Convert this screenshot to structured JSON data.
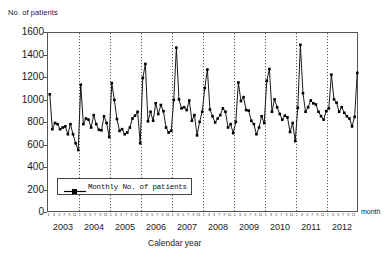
{
  "figure": {
    "y_axis_title": "No. of patients",
    "x_axis_title": "Calendar year",
    "month_axis_caption": "month"
  },
  "legend": {
    "label": "Monthly No. of patients",
    "marker": "line-with-square-marker"
  },
  "chart_data": {
    "type": "line",
    "title": "",
    "subtitle": "",
    "xlabel": "Calendar year",
    "ylabel": "No. of patients",
    "ylim": [
      0,
      1600
    ],
    "ytick_labels": [
      "0",
      "200",
      "400",
      "600",
      "800",
      "1000",
      "1200",
      "1400",
      "1600"
    ],
    "yticks": [
      0,
      200,
      400,
      600,
      800,
      1000,
      1200,
      1400,
      1600
    ],
    "grid": "vertical dotted gridlines at each January (year boundary)",
    "legend_position": "inside lower-left",
    "month_tick_labels": [
      "1",
      "3",
      "5",
      "7",
      "9",
      "11"
    ],
    "years": [
      "2003",
      "2004",
      "2005",
      "2006",
      "2007",
      "2008",
      "2009",
      "2010",
      "2011",
      "2012"
    ],
    "series": [
      {
        "name": "Monthly No. of patients",
        "marker": "filled square",
        "color": "#000000",
        "x": [
          "2003-01",
          "2003-02",
          "2003-03",
          "2003-04",
          "2003-05",
          "2003-06",
          "2003-07",
          "2003-08",
          "2003-09",
          "2003-10",
          "2003-11",
          "2003-12",
          "2004-01",
          "2004-02",
          "2004-03",
          "2004-04",
          "2004-05",
          "2004-06",
          "2004-07",
          "2004-08",
          "2004-09",
          "2004-10",
          "2004-11",
          "2004-12",
          "2005-01",
          "2005-02",
          "2005-03",
          "2005-04",
          "2005-05",
          "2005-06",
          "2005-07",
          "2005-08",
          "2005-09",
          "2005-10",
          "2005-11",
          "2005-12",
          "2006-01",
          "2006-02",
          "2006-03",
          "2006-04",
          "2006-05",
          "2006-06",
          "2006-07",
          "2006-08",
          "2006-09",
          "2006-10",
          "2006-11",
          "2006-12",
          "2007-01",
          "2007-02",
          "2007-03",
          "2007-04",
          "2007-05",
          "2007-06",
          "2007-07",
          "2007-08",
          "2007-09",
          "2007-10",
          "2007-11",
          "2007-12",
          "2008-01",
          "2008-02",
          "2008-03",
          "2008-04",
          "2008-05",
          "2008-06",
          "2008-07",
          "2008-08",
          "2008-09",
          "2008-10",
          "2008-11",
          "2008-12",
          "2009-01",
          "2009-02",
          "2009-03",
          "2009-04",
          "2009-05",
          "2009-06",
          "2009-07",
          "2009-08",
          "2009-09",
          "2009-10",
          "2009-11",
          "2009-12",
          "2010-01",
          "2010-02",
          "2010-03",
          "2010-04",
          "2010-05",
          "2010-06",
          "2010-07",
          "2010-08",
          "2010-09",
          "2010-10",
          "2010-11",
          "2010-12",
          "2011-01",
          "2011-02",
          "2011-03",
          "2011-04",
          "2011-05",
          "2011-06",
          "2011-07",
          "2011-08",
          "2011-09",
          "2011-10",
          "2011-11",
          "2011-12",
          "2012-01",
          "2012-02",
          "2012-03",
          "2012-04",
          "2012-05",
          "2012-06",
          "2012-07",
          "2012-08",
          "2012-09",
          "2012-10",
          "2012-11",
          "2012-12"
        ],
        "values": [
          1055,
          745,
          800,
          790,
          745,
          760,
          770,
          700,
          790,
          700,
          620,
          560,
          1140,
          790,
          840,
          830,
          760,
          870,
          790,
          740,
          735,
          860,
          800,
          675,
          1155,
          1005,
          835,
          730,
          745,
          700,
          715,
          760,
          840,
          865,
          900,
          620,
          1200,
          1325,
          815,
          900,
          820,
          975,
          880,
          960,
          905,
          760,
          715,
          730,
          1005,
          1470,
          1010,
          930,
          940,
          915,
          1000,
          820,
          870,
          690,
          810,
          900,
          1110,
          1275,
          920,
          860,
          805,
          840,
          870,
          930,
          900,
          760,
          790,
          710,
          810,
          1160,
          995,
          1030,
          915,
          910,
          820,
          790,
          700,
          760,
          860,
          800,
          1175,
          1280,
          900,
          1010,
          940,
          880,
          830,
          865,
          850,
          720,
          800,
          640,
          935,
          1495,
          1065,
          900,
          940,
          1000,
          975,
          965,
          900,
          860,
          830,
          905,
          930,
          1230,
          1010,
          980,
          900,
          940,
          890,
          860,
          840,
          770,
          855,
          1245
        ]
      }
    ]
  }
}
